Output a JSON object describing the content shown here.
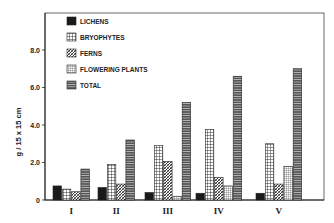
{
  "chart_data": {
    "type": "bar",
    "title": "",
    "xlabel": "",
    "ylabel": "g / 15 x 15 cm",
    "ylim": [
      0,
      8.0
    ],
    "yticks": [
      "0",
      "2.0",
      "4.0",
      "6.0",
      "8.0"
    ],
    "grid": false,
    "legend_position": "upper-left inside",
    "categories": [
      "I",
      "II",
      "III",
      "IV",
      "V"
    ],
    "series": [
      {
        "name": "LICHENS",
        "pattern": "solid",
        "values": [
          0.75,
          0.67,
          0.4,
          0.36,
          0.36
        ]
      },
      {
        "name": "BRYOPHYTES",
        "pattern": "grid",
        "values": [
          0.58,
          1.9,
          2.9,
          3.75,
          3.0
        ]
      },
      {
        "name": "FERNS",
        "pattern": "diagonal",
        "values": [
          0.44,
          0.85,
          2.05,
          1.2,
          0.85
        ]
      },
      {
        "name": "FLOWERING PLANTS",
        "pattern": "fine-grid",
        "values": [
          0,
          0,
          0.2,
          0.75,
          1.8
        ]
      },
      {
        "name": "TOTAL",
        "pattern": "horizontal",
        "values": [
          1.65,
          3.2,
          5.2,
          6.6,
          7.0
        ]
      }
    ]
  }
}
